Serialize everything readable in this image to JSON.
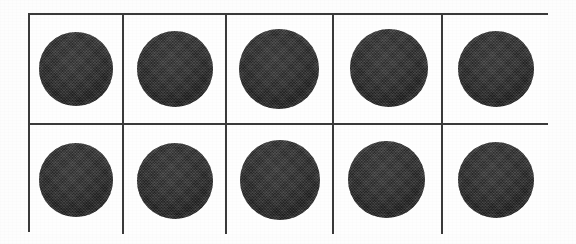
{
  "figure": {
    "kind": "specimen-grid-plate",
    "background_color": "#fdfdfd",
    "border_color": "#3a3a3a",
    "specimen_color": "#343434",
    "columns": 5,
    "rows": 2,
    "total_specimens": 10
  },
  "grid": {
    "cells": [
      {
        "id": "r1c1",
        "row": 1,
        "column": 1,
        "specimen": {
          "shape": "circle",
          "fill": "#343434",
          "diameter_px": 74,
          "offset_x_px": 0,
          "offset_y_px": 0
        }
      },
      {
        "id": "r1c2",
        "row": 1,
        "column": 2,
        "specimen": {
          "shape": "circle",
          "fill": "#343434",
          "diameter_px": 76,
          "offset_x_px": 0,
          "offset_y_px": 0
        }
      },
      {
        "id": "r1c3",
        "row": 1,
        "column": 3,
        "specimen": {
          "shape": "circle",
          "fill": "#343434",
          "diameter_px": 80,
          "offset_x_px": -1,
          "offset_y_px": 0
        }
      },
      {
        "id": "r1c4",
        "row": 1,
        "column": 4,
        "specimen": {
          "shape": "circle",
          "fill": "#343434",
          "diameter_px": 78,
          "offset_x_px": 1,
          "offset_y_px": -1
        }
      },
      {
        "id": "r1c5",
        "row": 1,
        "column": 5,
        "specimen": {
          "shape": "circle",
          "fill": "#343434",
          "diameter_px": 76,
          "offset_x_px": 0,
          "offset_y_px": 0
        }
      },
      {
        "id": "r2c1",
        "row": 2,
        "column": 1,
        "specimen": {
          "shape": "circle",
          "fill": "#343434",
          "diameter_px": 74,
          "offset_x_px": 0,
          "offset_y_px": 0
        }
      },
      {
        "id": "r2c2",
        "row": 2,
        "column": 2,
        "specimen": {
          "shape": "circle",
          "fill": "#343434",
          "diameter_px": 76,
          "offset_x_px": 0,
          "offset_y_px": 1
        }
      },
      {
        "id": "r2c3",
        "row": 2,
        "column": 3,
        "specimen": {
          "shape": "circle",
          "fill": "#343434",
          "diameter_px": 80,
          "offset_x_px": 0,
          "offset_y_px": 0
        }
      },
      {
        "id": "r2c4",
        "row": 2,
        "column": 4,
        "specimen": {
          "shape": "circle",
          "fill": "#343434",
          "diameter_px": 77,
          "offset_x_px": -1,
          "offset_y_px": 0
        }
      },
      {
        "id": "r2c5",
        "row": 2,
        "column": 5,
        "specimen": {
          "shape": "circle",
          "fill": "#343434",
          "diameter_px": 76,
          "offset_x_px": 0,
          "offset_y_px": 0
        }
      }
    ]
  }
}
